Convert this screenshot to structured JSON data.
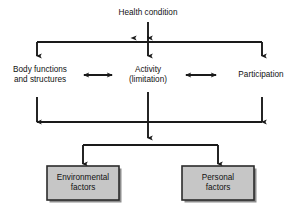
{
  "figure": {
    "type": "flow-diagram",
    "background_color": "#ffffff",
    "line_color": "#1a1a1a",
    "text_color": "#111111",
    "box_fill_color": "#c6c6c6",
    "box_border_color": "#2b2b2b",
    "box_shadow_color": "#8d8d8d"
  },
  "nodes": {
    "health_condition": {
      "label": "Health condition",
      "x": 148,
      "y": 13
    },
    "body_functions": {
      "label": "Body functions\nand structures",
      "x": 39,
      "y": 75
    },
    "activity": {
      "label": "Activity\n(limitation)",
      "x": 148,
      "y": 75
    },
    "participation": {
      "label": "Participation",
      "x": 261,
      "y": 75
    },
    "environmental_factors": {
      "label": "Environmental\nfactors",
      "x": 83,
      "y": 183,
      "box": {
        "left": 47,
        "top": 166,
        "width": 72,
        "height": 34
      }
    },
    "personal_factors": {
      "label": "Personal\nfactors",
      "x": 218,
      "y": 183,
      "box": {
        "left": 182,
        "top": 166,
        "width": 72,
        "height": 34
      }
    }
  },
  "connectors": [
    {
      "name": "health-to-activity-up",
      "kind": "double-vertical",
      "note": "Activity ↔ Health condition"
    },
    {
      "name": "top-distribution-bracket",
      "kind": "bracket-down",
      "note": "Health condition down to Body functions, Activity, Participation"
    },
    {
      "name": "body-activity-double",
      "kind": "double-horizontal",
      "note": "Body functions ↔ Activity"
    },
    {
      "name": "activity-participation-double",
      "kind": "double-horizontal",
      "note": "Activity ↔ Participation"
    },
    {
      "name": "bottom-return-bracket",
      "kind": "bracket-up",
      "note": "Return arrows up into Body functions and Participation"
    },
    {
      "name": "contextual-factors-bracket",
      "kind": "bracket-down",
      "note": "Down to Environmental factors and Personal factors"
    }
  ],
  "caption": {
    "text": ""
  }
}
